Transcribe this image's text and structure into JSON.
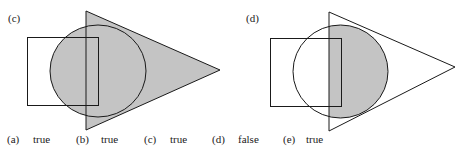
{
  "diagrams": [
    {
      "label": "(c)",
      "description": "Square, circle and triangle; shaded region = circle ∪ triangle",
      "fill_color": "#c4c4c4",
      "stroke_color": "#1a1a1a"
    },
    {
      "label": "(d)",
      "description": "Square, circle and triangle; shaded region = circle ∩ triangle",
      "fill_color": "#c4c4c4",
      "stroke_color": "#1a1a1a"
    }
  ],
  "answers": [
    {
      "letter": "(a)",
      "value": "true"
    },
    {
      "letter": "(b)",
      "value": "true"
    },
    {
      "letter": "(c)",
      "value": "true"
    },
    {
      "letter": "(d)",
      "value": "false"
    },
    {
      "letter": "(e)",
      "value": "true"
    }
  ]
}
